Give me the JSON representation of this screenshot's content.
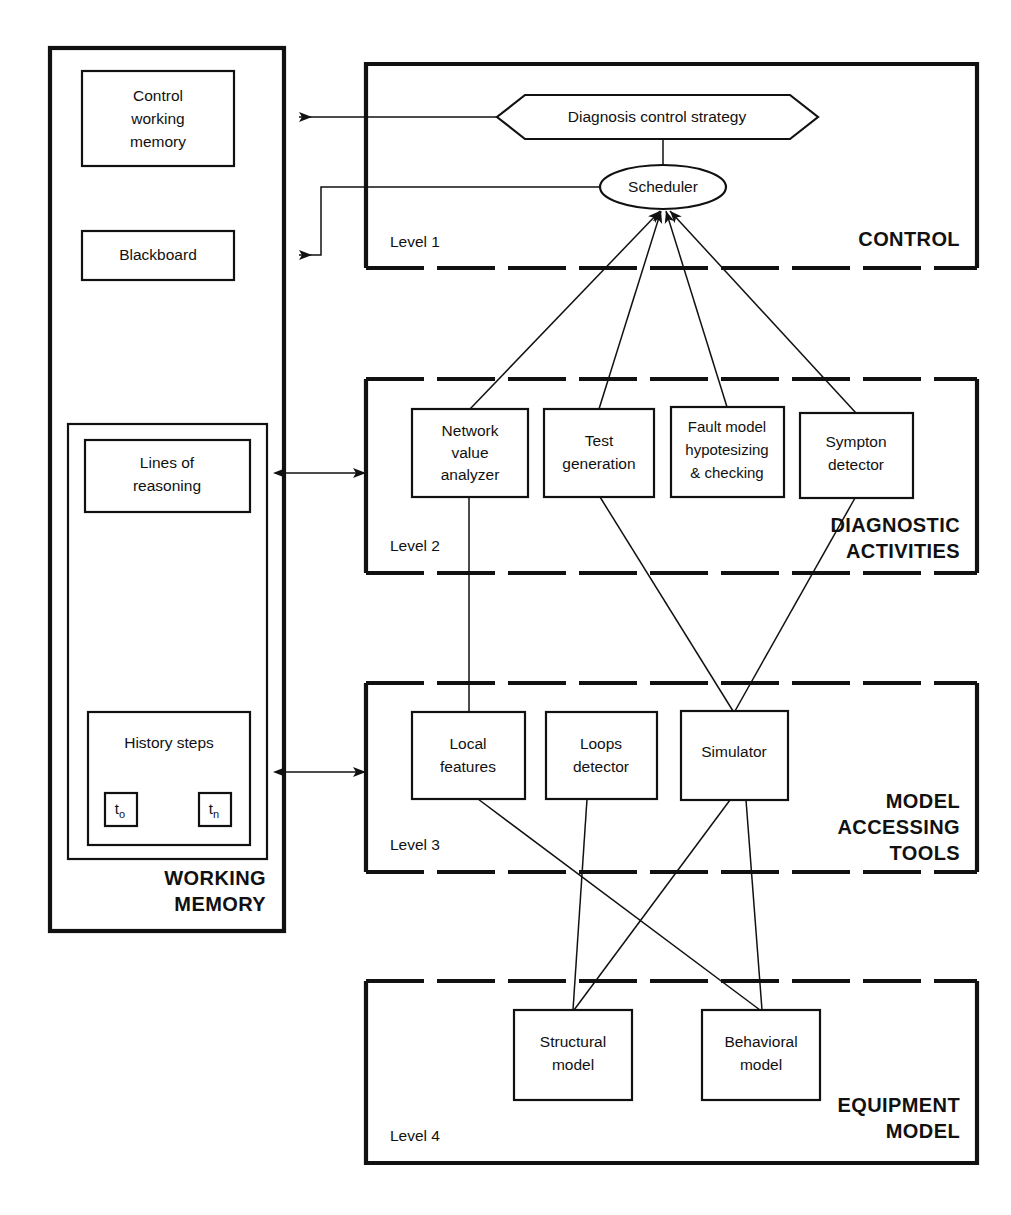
{
  "figure": {
    "caption": ""
  },
  "working_memory": {
    "zone_label_line1": "WORKING",
    "zone_label_line2": "MEMORY",
    "boxes": [
      {
        "id": "control-working-memory",
        "lines": [
          "Control",
          "working",
          "memory"
        ]
      },
      {
        "id": "blackboard",
        "lines": [
          "Blackboard"
        ]
      },
      {
        "id": "lines-of-reasoning",
        "lines": [
          "Lines of",
          "reasoning"
        ]
      },
      {
        "id": "history-steps",
        "lines": [
          "History steps"
        ]
      }
    ],
    "time_markers": [
      {
        "id": "t-zero",
        "base": "t",
        "sub": "o"
      },
      {
        "id": "t-n",
        "base": "t",
        "sub": "n"
      }
    ]
  },
  "levels": [
    {
      "id": "level-1",
      "level_label": "Level 1",
      "zone_label_lines": [
        "CONTROL"
      ],
      "nodes": [
        {
          "id": "diagnosis-control-strategy",
          "shape": "hexagon",
          "lines": [
            "Diagnosis control strategy"
          ]
        },
        {
          "id": "scheduler",
          "shape": "ellipse",
          "lines": [
            "Scheduler"
          ]
        }
      ]
    },
    {
      "id": "level-2",
      "level_label": "Level 2",
      "zone_label_lines": [
        "DIAGNOSTIC",
        "ACTIVITIES"
      ],
      "nodes": [
        {
          "id": "network-value-analyzer",
          "shape": "rect",
          "lines": [
            "Network",
            "value",
            "analyzer"
          ]
        },
        {
          "id": "test-generation",
          "shape": "rect",
          "lines": [
            "Test",
            "generation"
          ]
        },
        {
          "id": "fault-model-hypotesizing-checking",
          "shape": "rect",
          "lines": [
            "Fault model",
            "hypotesizing",
            "& checking"
          ]
        },
        {
          "id": "sympton-detector",
          "shape": "rect",
          "lines": [
            "Sympton",
            "detector"
          ]
        }
      ]
    },
    {
      "id": "level-3",
      "level_label": "Level 3",
      "zone_label_lines": [
        "MODEL",
        "ACCESSING",
        "TOOLS"
      ],
      "nodes": [
        {
          "id": "local-features",
          "shape": "rect",
          "lines": [
            "Local",
            "features"
          ]
        },
        {
          "id": "loops-detector",
          "shape": "rect",
          "lines": [
            "Loops",
            "detector"
          ]
        },
        {
          "id": "simulator",
          "shape": "rect",
          "lines": [
            "Simulator"
          ]
        }
      ]
    },
    {
      "id": "level-4",
      "level_label": "Level 4",
      "zone_label_lines": [
        "EQUIPMENT",
        "MODEL"
      ],
      "nodes": [
        {
          "id": "structural-model",
          "shape": "rect",
          "lines": [
            "Structural",
            "model"
          ]
        },
        {
          "id": "behavioral-model",
          "shape": "rect",
          "lines": [
            "Behavioral",
            "model"
          ]
        }
      ]
    }
  ],
  "connections": [
    {
      "id": "strategy-to-control-working-memory",
      "from": "diagnosis-control-strategy",
      "to": "control-working-memory",
      "arrow": "single"
    },
    {
      "id": "strategy-to-scheduler",
      "from": "diagnosis-control-strategy",
      "to": "scheduler",
      "arrow": "none"
    },
    {
      "id": "scheduler-to-blackboard",
      "from": "scheduler",
      "to": "blackboard",
      "arrow": "single"
    },
    {
      "id": "network-value-analyzer-to-scheduler",
      "from": "network-value-analyzer",
      "to": "scheduler",
      "arrow": "single"
    },
    {
      "id": "test-generation-to-scheduler",
      "from": "test-generation",
      "to": "scheduler",
      "arrow": "single"
    },
    {
      "id": "fault-model-to-scheduler",
      "from": "fault-model-hypotesizing-checking",
      "to": "scheduler",
      "arrow": "single"
    },
    {
      "id": "sympton-detector-to-scheduler",
      "from": "sympton-detector",
      "to": "scheduler",
      "arrow": "single"
    },
    {
      "id": "lines-of-reasoning-to-level-2",
      "from": "lines-of-reasoning",
      "to": "level-2",
      "arrow": "double"
    },
    {
      "id": "history-steps-to-level-3",
      "from": "history-steps",
      "to": "level-3",
      "arrow": "double"
    },
    {
      "id": "network-value-analyzer-to-local-features",
      "from": "network-value-analyzer",
      "to": "local-features",
      "arrow": "none"
    },
    {
      "id": "test-generation-to-simulator",
      "from": "test-generation",
      "to": "simulator",
      "arrow": "none"
    },
    {
      "id": "sympton-detector-to-simulator",
      "from": "sympton-detector",
      "to": "simulator",
      "arrow": "none"
    },
    {
      "id": "local-features-to-behavioral-model",
      "from": "local-features",
      "to": "behavioral-model",
      "arrow": "none"
    },
    {
      "id": "loops-detector-to-structural-model",
      "from": "loops-detector",
      "to": "structural-model",
      "arrow": "none"
    },
    {
      "id": "simulator-to-structural-model",
      "from": "simulator",
      "to": "structural-model",
      "arrow": "none"
    },
    {
      "id": "simulator-to-behavioral-model",
      "from": "simulator",
      "to": "behavioral-model",
      "arrow": "none"
    }
  ],
  "colors": {
    "ink": "#111111",
    "paper": "#ffffff"
  }
}
